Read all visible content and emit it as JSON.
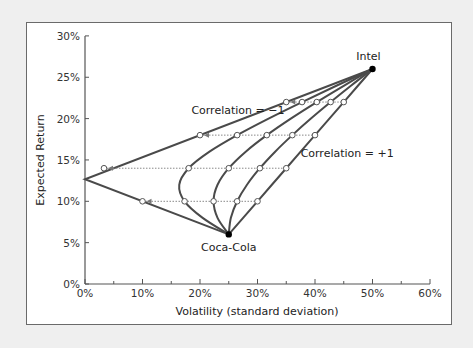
{
  "chart_data": {
    "type": "line",
    "title": "",
    "xlabel": "Volatility (standard deviation)",
    "ylabel": "Expected Return",
    "xlim": [
      0,
      60
    ],
    "ylim": [
      0,
      30
    ],
    "x_ticks": [
      "0%",
      "10%",
      "20%",
      "30%",
      "40%",
      "50%",
      "60%"
    ],
    "y_ticks": [
      "0%",
      "5%",
      "10%",
      "15%",
      "20%",
      "25%",
      "30%"
    ],
    "grid": false,
    "legend": null,
    "assets": [
      {
        "name": "Intel",
        "volatility": 50,
        "return": 26
      },
      {
        "name": "Coca-Cola",
        "volatility": 25,
        "return": 6
      }
    ],
    "annotations": [
      {
        "text": "Correlation = −1",
        "x": 18.5,
        "y": 20.5
      },
      {
        "text": "Correlation = +1",
        "x": 37.5,
        "y": 15.3
      }
    ],
    "series": [
      {
        "name": "Correlation = -1",
        "points": [
          [
            25,
            6
          ],
          [
            20,
            8
          ],
          [
            15,
            10
          ],
          [
            10,
            12
          ],
          [
            5,
            14
          ],
          [
            0,
            16
          ],
          [
            5,
            18
          ],
          [
            10,
            20
          ],
          [
            15,
            22
          ],
          [
            20,
            24
          ],
          [
            25,
            26
          ],
          [
            50,
            26
          ]
        ]
      },
      {
        "name": "Correlation = -0.5",
        "points": [
          [
            25,
            6
          ],
          [
            20.46,
            8
          ],
          [
            17.32,
            10
          ],
          [
            16.39,
            12
          ],
          [
            18.03,
            14
          ],
          [
            21.65,
            16
          ],
          [
            26.46,
            18
          ],
          [
            31.92,
            20
          ],
          [
            37.75,
            22
          ],
          [
            43.8,
            24
          ],
          [
            50,
            26
          ]
        ]
      },
      {
        "name": "Correlation = 0",
        "points": [
          [
            25,
            6
          ],
          [
            23.05,
            8
          ],
          [
            22.36,
            10
          ],
          [
            23.05,
            12
          ],
          [
            25,
            14
          ],
          [
            27.95,
            16
          ],
          [
            31.62,
            18
          ],
          [
            35.79,
            20
          ],
          [
            40.31,
            22
          ],
          [
            45.07,
            24
          ],
          [
            50,
            26
          ]
        ]
      },
      {
        "name": "Correlation = +0.5",
        "points": [
          [
            25,
            6
          ],
          [
            25.37,
            8
          ],
          [
            26.46,
            10
          ],
          [
            28.17,
            12
          ],
          [
            30.41,
            14
          ],
          [
            33.07,
            16
          ],
          [
            36.06,
            18
          ],
          [
            39.29,
            20
          ],
          [
            42.72,
            22
          ],
          [
            46.3,
            24
          ],
          [
            50,
            26
          ]
        ]
      },
      {
        "name": "Correlation = +1",
        "points": [
          [
            25,
            6
          ],
          [
            27.5,
            8
          ],
          [
            30,
            10
          ],
          [
            32.5,
            12
          ],
          [
            35,
            14
          ],
          [
            37.5,
            16
          ],
          [
            40,
            18
          ],
          [
            42.5,
            20
          ],
          [
            45,
            22
          ],
          [
            47.5,
            24
          ],
          [
            50,
            26
          ]
        ]
      }
    ],
    "dotted_rows": [
      {
        "return": 10,
        "volatilities": [
          10,
          17.32,
          22.36,
          26.46,
          30
        ]
      },
      {
        "return": 14,
        "volatilities": [
          3.3,
          18.03,
          25,
          30.41,
          35
        ]
      },
      {
        "return": 18,
        "volatilities": [
          20,
          26.46,
          31.62,
          36.06,
          40
        ]
      },
      {
        "return": 22,
        "volatilities": [
          35,
          37.75,
          40.31,
          42.72,
          45
        ]
      }
    ]
  }
}
